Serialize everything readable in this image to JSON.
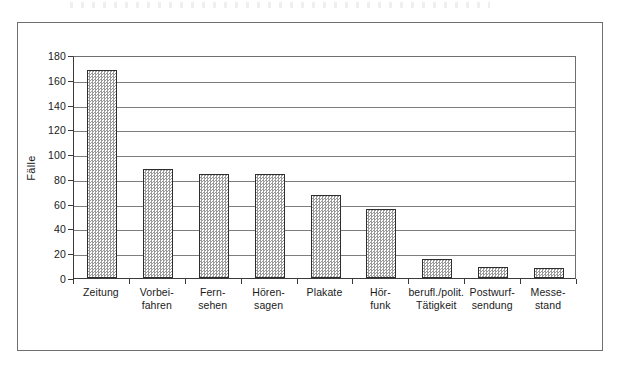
{
  "figure": {
    "frame_border_color": "#6f6f6f",
    "background": "#ffffff"
  },
  "chart_data": {
    "type": "bar",
    "title": "",
    "xlabel": "",
    "ylabel": "Fälle",
    "ylim": [
      0,
      180
    ],
    "ytick_step": 20,
    "grid": true,
    "legend": null,
    "bar_fill": "checkerboard-gray",
    "bar_edge_color": "#2e2e2e",
    "categories": [
      "Zeitung",
      "Vorbei-fahren",
      "Fern-sehen",
      "Hören-sagen",
      "Plakate",
      "Hör-funk",
      "berufl./polit. Tätigkeit",
      "Postwurf-sendung",
      "Messe-stand"
    ],
    "category_lines": [
      [
        "Zeitung",
        ""
      ],
      [
        "Vorbei-",
        "fahren"
      ],
      [
        "Fern-",
        "sehen"
      ],
      [
        "Hören-",
        "sagen"
      ],
      [
        "Plakate",
        ""
      ],
      [
        "Hör-",
        "funk"
      ],
      [
        "berufl./polit.",
        "Tätigkeit"
      ],
      [
        "Postwurf-",
        "sendung"
      ],
      [
        "Messe-",
        "stand"
      ]
    ],
    "values": [
      168,
      88,
      84,
      84,
      67,
      56,
      15,
      9,
      8
    ],
    "ytick_labels": [
      "0",
      "20",
      "40",
      "60",
      "80",
      "100",
      "120",
      "140",
      "160",
      "180"
    ],
    "ytick_values": [
      0,
      20,
      40,
      60,
      80,
      100,
      120,
      140,
      160,
      180
    ]
  }
}
